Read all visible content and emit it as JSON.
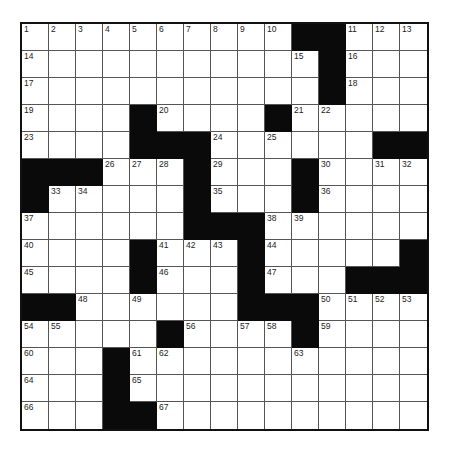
{
  "puzzle": {
    "rows": 15,
    "cols": 15,
    "colors": {
      "block": "#0a0a0a",
      "cell": "#ffffff",
      "line": "#555555",
      "border": "#111111"
    },
    "grid": [
      "..........##...",
      "...........#...",
      "...........#...",
      "....#....#.....",
      "....###......##",
      "###...#...#....",
      "#.....#...#....",
      "......###......",
      "....#...#.....#",
      "....#...#...###",
      "##......###....",
      ".....#....#....",
      "...#...........",
      "...#...........",
      "...##.........."
    ],
    "numbers": [
      [
        1,
        2,
        3,
        4,
        5,
        6,
        7,
        8,
        9,
        10,
        0,
        0,
        11,
        12,
        13
      ],
      [
        14,
        0,
        0,
        0,
        0,
        0,
        0,
        0,
        0,
        0,
        15,
        0,
        16,
        0,
        0
      ],
      [
        17,
        0,
        0,
        0,
        0,
        0,
        0,
        0,
        0,
        0,
        0,
        0,
        18,
        0,
        0
      ],
      [
        19,
        0,
        0,
        0,
        0,
        20,
        0,
        0,
        0,
        0,
        21,
        22,
        0,
        0,
        0
      ],
      [
        23,
        0,
        0,
        0,
        0,
        0,
        0,
        24,
        0,
        25,
        0,
        0,
        0,
        0,
        0
      ],
      [
        0,
        0,
        0,
        26,
        27,
        28,
        0,
        29,
        0,
        0,
        0,
        30,
        0,
        31,
        32
      ],
      [
        0,
        33,
        34,
        0,
        0,
        0,
        0,
        35,
        0,
        0,
        0,
        36,
        0,
        0,
        0
      ],
      [
        37,
        0,
        0,
        0,
        0,
        0,
        0,
        0,
        0,
        38,
        39,
        0,
        0,
        0,
        0
      ],
      [
        40,
        0,
        0,
        0,
        0,
        41,
        42,
        43,
        0,
        44,
        0,
        0,
        0,
        0,
        0
      ],
      [
        45,
        0,
        0,
        0,
        0,
        46,
        0,
        0,
        0,
        47,
        0,
        0,
        0,
        0,
        0
      ],
      [
        0,
        0,
        48,
        0,
        49,
        0,
        0,
        0,
        0,
        0,
        0,
        50,
        51,
        52,
        53
      ],
      [
        54,
        55,
        0,
        0,
        0,
        0,
        56,
        0,
        57,
        58,
        0,
        59,
        0,
        0,
        0
      ],
      [
        60,
        0,
        0,
        0,
        61,
        62,
        0,
        0,
        0,
        0,
        63,
        0,
        0,
        0,
        0
      ],
      [
        64,
        0,
        0,
        0,
        65,
        0,
        0,
        0,
        0,
        0,
        0,
        0,
        0,
        0,
        0
      ],
      [
        66,
        0,
        0,
        0,
        0,
        67,
        0,
        0,
        0,
        0,
        0,
        0,
        0,
        0,
        0
      ]
    ]
  }
}
